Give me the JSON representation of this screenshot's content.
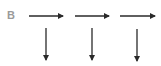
{
  "panel": {
    "label": "B"
  },
  "colors": {
    "arrow": "#2a2a2a",
    "label": "#9a9a9a",
    "background": "#ffffff"
  },
  "arrows": {
    "horizontal": [
      {
        "x1": 29,
        "x2": 63,
        "y": 16
      },
      {
        "x1": 75,
        "x2": 109,
        "y": 16
      },
      {
        "x1": 120,
        "x2": 155,
        "y": 16
      }
    ],
    "vertical": [
      {
        "x": 46,
        "y1": 28,
        "y2": 60
      },
      {
        "x": 92,
        "y1": 28,
        "y2": 60
      },
      {
        "x": 137,
        "y1": 29,
        "y2": 61
      }
    ]
  }
}
